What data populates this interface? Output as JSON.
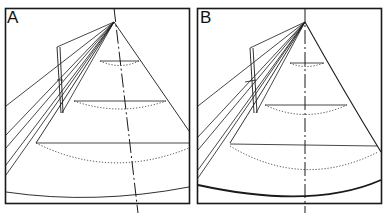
{
  "figure": {
    "panels": [
      {
        "label": "A",
        "variant": "inclined-axis"
      },
      {
        "label": "B",
        "variant": "vertical-axis"
      }
    ],
    "colors": {
      "stroke": "#1a1a1a",
      "background": "#ffffff"
    }
  }
}
